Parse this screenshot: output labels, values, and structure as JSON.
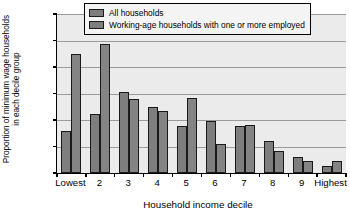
{
  "chart_data": {
    "type": "bar",
    "title": "",
    "xlabel": "Household income decile",
    "ylabel_line1": "Proportion of minimum wage households",
    "ylabel_line2": "in each decile group",
    "categories": [
      "Lowest",
      "2",
      "3",
      "4",
      "5",
      "6",
      "7",
      "8",
      "9",
      "Highest"
    ],
    "series": [
      {
        "name": "All households",
        "color": "#7e7e7e",
        "values": [
          8.0,
          11.2,
          15.3,
          12.5,
          8.8,
          9.9,
          8.9,
          6.1,
          3.0,
          1.3
        ]
      },
      {
        "name": "Working-age households with one or more employed",
        "color": "#848484",
        "values": [
          22.4,
          24.4,
          14.0,
          11.7,
          14.2,
          5.5,
          9.1,
          4.2,
          2.2,
          2.2
        ]
      }
    ],
    "ylim": [
      0,
      30
    ],
    "yticks": [
      0,
      5,
      10,
      15,
      20,
      25,
      30
    ],
    "ytick_labels": [
      "0",
      "5",
      "10",
      "15",
      "20",
      "25",
      "30"
    ],
    "grid": true,
    "legend_position": "top-center"
  },
  "legend": {
    "items": [
      {
        "label": "All households"
      },
      {
        "label": "Working-age households with one or more employed"
      }
    ]
  }
}
